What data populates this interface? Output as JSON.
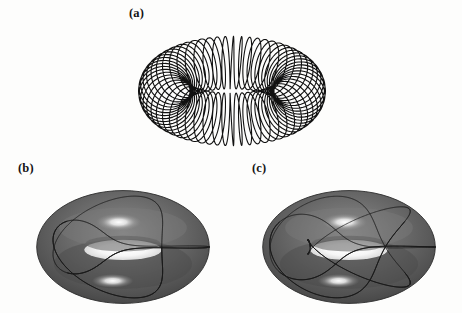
{
  "figure": {
    "background_color": "#fdfdfc",
    "ink_color": "#111111",
    "panels": [
      {
        "id": "a",
        "label": "(a)",
        "caption_position": "top-left",
        "description": "dense quasi-periodic winding curve on a torus, line drawing",
        "render_style": "wireframe-line",
        "surface_fill": "none",
        "curve_color": "#111111"
      },
      {
        "id": "b",
        "label": "(b)",
        "caption_position": "top-left",
        "description": "shaded gray torus with a simple closed torus knot curve",
        "render_style": "shaded-surface",
        "surface_fill": "#5a5a5a",
        "highlight_color": "#ffffff",
        "curve_color": "#1a1a1a"
      },
      {
        "id": "c",
        "label": "(c)",
        "caption_position": "top-left",
        "description": "shaded gray torus with a more complex multi-winding closed curve",
        "render_style": "shaded-surface",
        "surface_fill": "#5a5a5a",
        "highlight_color": "#ffffff",
        "curve_color": "#1a1a1a"
      }
    ]
  },
  "chart_data": {
    "type": "line",
    "title": "",
    "xlabel": "",
    "ylabel": "",
    "torus_geometry": {
      "major_radius_R": 1.0,
      "minor_radius_r": 0.38,
      "projection": "oblique axonometric",
      "view_elevation_deg": 22,
      "vertical_squash": 0.42
    },
    "series": [
      {
        "name": "panel-a-winding",
        "panel": "a",
        "winding_p": 1,
        "winding_q": 60,
        "turns": 60,
        "closed": true,
        "samples": 3600,
        "stroke_width": 1.1,
        "color": "#111111"
      },
      {
        "name": "panel-b-knot",
        "panel": "b",
        "winding_p": 2,
        "winding_q": 3,
        "turns": 3,
        "closed": true,
        "samples": 900,
        "stroke_width": 1.0,
        "color": "#1a1a1a"
      },
      {
        "name": "panel-c-knot",
        "panel": "c",
        "winding_p": 3,
        "winding_q": 5,
        "turns": 5,
        "closed": true,
        "samples": 1200,
        "stroke_width": 1.0,
        "color": "#1a1a1a"
      }
    ],
    "legend": [],
    "grid": false,
    "axes_visible": false
  }
}
